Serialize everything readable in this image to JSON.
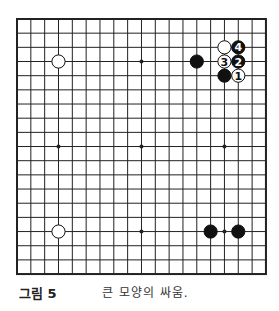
{
  "board": {
    "size": 19,
    "origin_x": 17,
    "origin_y": 19,
    "spacing_x": 13.83,
    "spacing_y": 14.17,
    "line_color": "#222222",
    "background": "#ffffff",
    "star_points": [
      [
        3,
        3
      ],
      [
        9,
        3
      ],
      [
        15,
        3
      ],
      [
        3,
        9
      ],
      [
        9,
        9
      ],
      [
        15,
        9
      ],
      [
        3,
        15
      ],
      [
        9,
        15
      ],
      [
        15,
        15
      ]
    ],
    "stones": [
      {
        "color": "white",
        "col": 3,
        "row": 3,
        "label": ""
      },
      {
        "color": "black",
        "col": 13,
        "row": 3,
        "label": ""
      },
      {
        "color": "white",
        "col": 15,
        "row": 2,
        "label": ""
      },
      {
        "color": "black",
        "col": 16,
        "row": 2,
        "label": "4"
      },
      {
        "color": "white",
        "col": 15,
        "row": 3,
        "label": "3"
      },
      {
        "color": "black",
        "col": 16,
        "row": 3,
        "label": "2"
      },
      {
        "color": "black",
        "col": 15,
        "row": 4,
        "label": ""
      },
      {
        "color": "white",
        "col": 16,
        "row": 4,
        "label": "1"
      },
      {
        "color": "white",
        "col": 3,
        "row": 15,
        "label": ""
      },
      {
        "color": "black",
        "col": 14,
        "row": 15,
        "label": ""
      },
      {
        "color": "black",
        "col": 16,
        "row": 15,
        "label": ""
      }
    ]
  },
  "caption": {
    "figure_label": "그림 5",
    "text": "큰 모양의 싸움."
  }
}
